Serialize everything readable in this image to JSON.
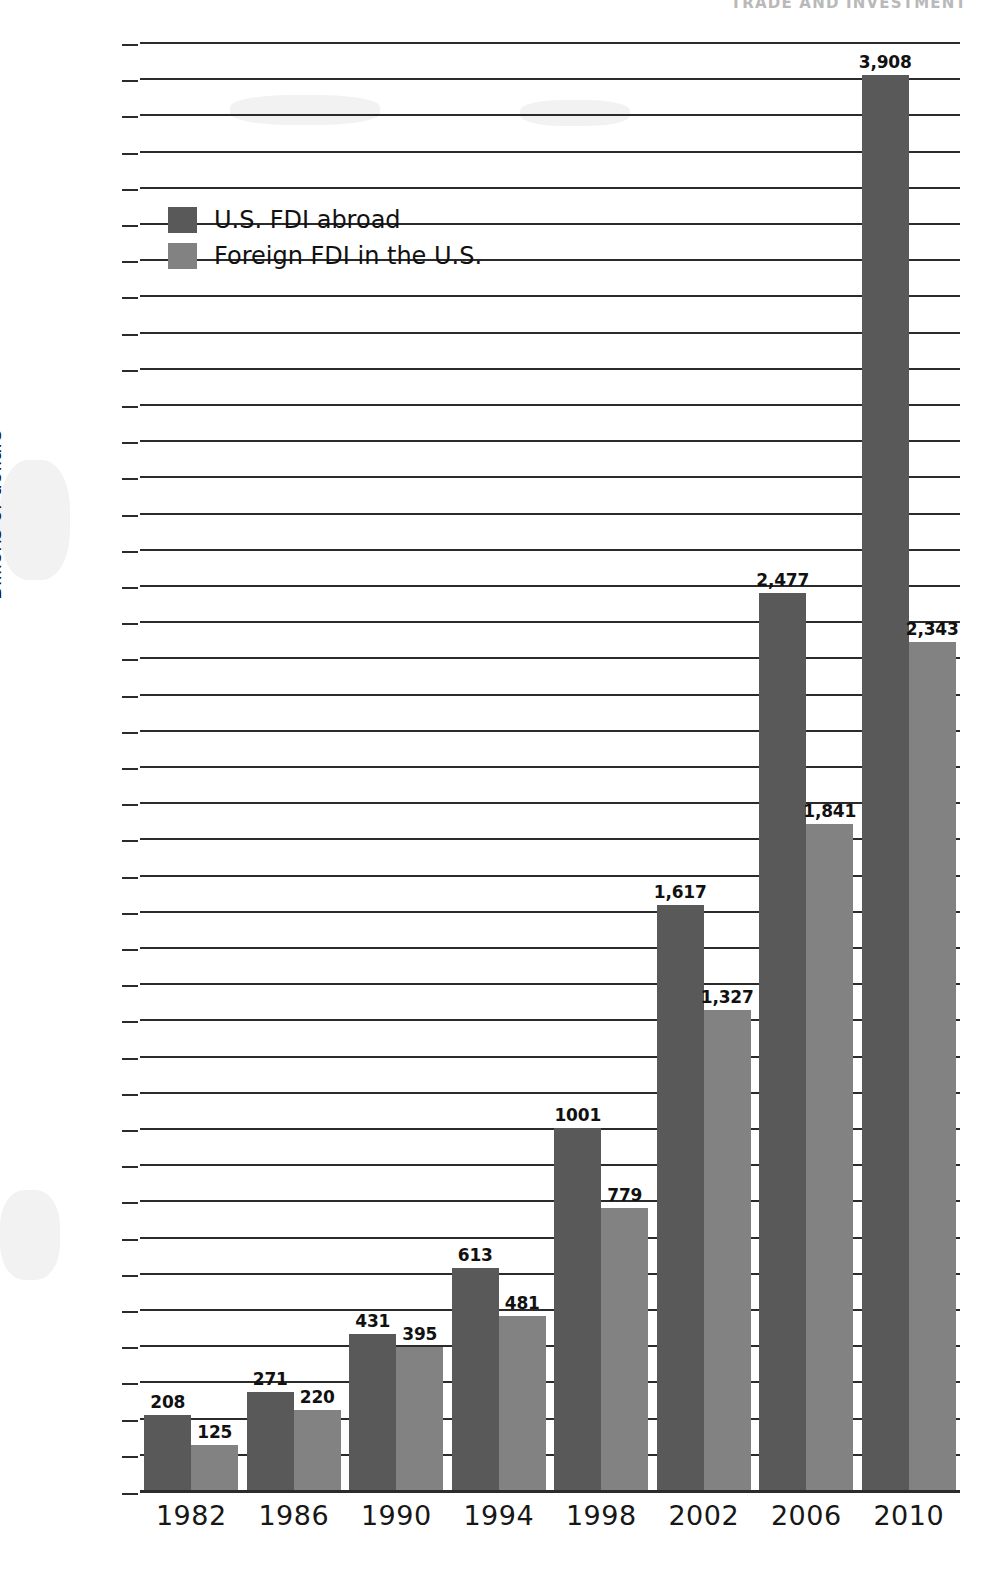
{
  "running_head": "TRADE AND INVESTMENT",
  "axis": {
    "ylabel": "Billions of dollars",
    "ytick_labels": [
      "4,000",
      "3,900",
      "3,800",
      "3,700",
      "3,600",
      "3,500",
      "3,400",
      "3,300",
      "3,200",
      "3,100",
      "3,000",
      "2,900",
      "2,800",
      "2,700",
      "2,600",
      "2,500",
      "2,400",
      "2,300",
      "2,200",
      "2,100",
      "2,000",
      "1,900",
      "1,800",
      "1,700",
      "1,600",
      "1,500",
      "1,400",
      "1,300",
      "1,200",
      "1,100",
      "1,000",
      "900",
      "800",
      "700",
      "600",
      "500",
      "400",
      "300",
      "200",
      "100",
      "0"
    ],
    "xtick_labels": [
      "1982",
      "1986",
      "1990",
      "1994",
      "1998",
      "2002",
      "2006",
      "2010"
    ]
  },
  "legend": {
    "items": [
      {
        "label": "U.S. FDI abroad",
        "color": "#595959"
      },
      {
        "label": "Foreign FDI in the U.S.",
        "color": "#828282"
      }
    ]
  },
  "bar_labels": {
    "us_abroad": [
      "208",
      "271",
      "431",
      "613",
      "1001",
      "1,617",
      "2,477",
      "3,908"
    ],
    "foreign_in_us": [
      "125",
      "220",
      "395",
      "481",
      "779",
      "1,327",
      "1,841",
      "2,343"
    ]
  },
  "chart_data": {
    "type": "bar",
    "title": "",
    "xlabel": "",
    "ylabel": "Billions of dollars",
    "ylim": [
      0,
      4000
    ],
    "ytick_step": 100,
    "grid": true,
    "legend_position": "upper-left-inside",
    "categories": [
      "1982",
      "1986",
      "1990",
      "1994",
      "1998",
      "2002",
      "2006",
      "2010"
    ],
    "series": [
      {
        "name": "U.S. FDI abroad",
        "color": "#595959",
        "values": [
          208,
          271,
          431,
          613,
          1001,
          1617,
          2477,
          3908
        ]
      },
      {
        "name": "Foreign FDI in the U.S.",
        "color": "#828282",
        "values": [
          125,
          220,
          395,
          481,
          779,
          1327,
          1841,
          2343
        ]
      }
    ]
  }
}
